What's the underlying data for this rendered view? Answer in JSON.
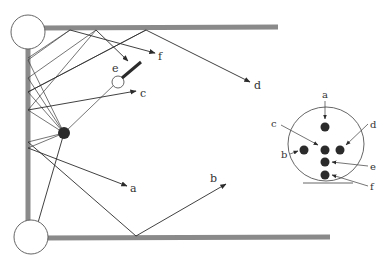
{
  "diagram": {
    "type": "ray-reflection-schematic",
    "colors": {
      "wall": "#8a8a8a",
      "line": "#2b2b2b",
      "dot": "#2b2b2b",
      "background": "#ffffff"
    },
    "main_labels": {
      "a": "a",
      "b": "b",
      "c": "c",
      "d": "d",
      "e": "e",
      "f": "f"
    },
    "target_labels": {
      "a": "a",
      "b": "b",
      "c": "c",
      "d": "d",
      "e": "e",
      "f": "f"
    }
  }
}
